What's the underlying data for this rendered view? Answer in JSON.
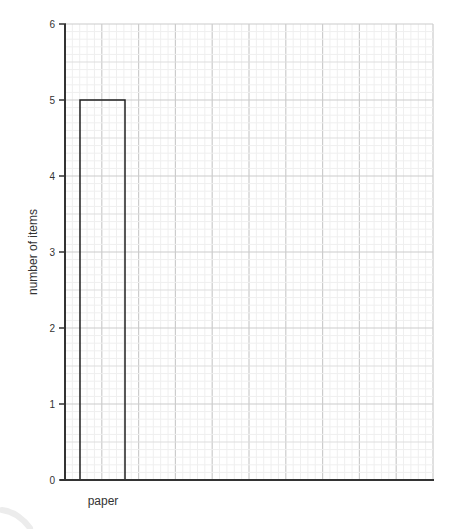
{
  "chart_data": {
    "type": "bar",
    "title": "",
    "xlabel": "",
    "ylabel": "number of items",
    "categories": [
      "paper"
    ],
    "values": [
      5
    ],
    "ylim": [
      0,
      6
    ],
    "yticks": [
      0,
      1,
      2,
      3,
      4,
      5,
      6
    ],
    "grid": true,
    "legend": null,
    "bar_style": "outline only (no fill)"
  },
  "labels": {
    "ylabel": "number of items",
    "category_0": "paper",
    "ytick_0": "0",
    "ytick_1": "1",
    "ytick_2": "2",
    "ytick_3": "3",
    "ytick_4": "4",
    "ytick_5": "5",
    "ytick_6": "6"
  },
  "colors": {
    "axis": "#333333",
    "bar_outline": "#222222",
    "major_grid": "#cccccc",
    "mid_grid": "#dddddd",
    "minor_grid": "#efefef",
    "background": "#ffffff"
  }
}
